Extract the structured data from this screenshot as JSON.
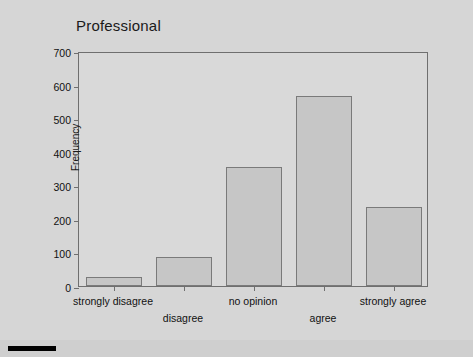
{
  "chart_data": {
    "type": "bar",
    "title": "Professional",
    "xlabel": "",
    "ylabel": "Frequency",
    "categories": [
      "strongly disagree",
      "disagree",
      "no opinion",
      "agree",
      "strongly agree"
    ],
    "values": [
      27,
      85,
      355,
      567,
      235
    ],
    "ylim": [
      0,
      700
    ],
    "yticks": [
      0,
      100,
      200,
      300,
      400,
      500,
      600,
      700
    ],
    "ytick_labels": [
      "0",
      "100",
      "200",
      "300",
      "400",
      "500",
      "600",
      "700"
    ],
    "grid": false,
    "legend": null,
    "bar_fill_color": "#c6c6c6",
    "bar_border_color": "#7a7a7a",
    "plot_background_color": "#d9d9d9",
    "page_background_color": "#d4d4d4",
    "axis_color": "#6f6f6f",
    "text_color": "#111111",
    "label_rows": [
      {
        "index": 0,
        "label": "strongly disagree",
        "row": 0
      },
      {
        "index": 1,
        "label": "disagree",
        "row": 1
      },
      {
        "index": 2,
        "label": "no opinion",
        "row": 0
      },
      {
        "index": 3,
        "label": "agree",
        "row": 1
      },
      {
        "index": 4,
        "label": "strongly agree",
        "row": 0
      }
    ]
  }
}
